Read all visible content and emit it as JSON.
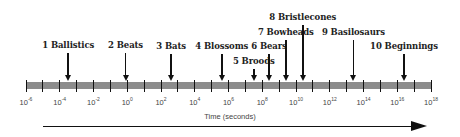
{
  "diagram": {
    "axis_title": "Time (seconds)",
    "axis": {
      "min_exp": -6,
      "max_exp": 18,
      "label_step": 2,
      "tick_step": 1
    },
    "tick_labels": [
      {
        "base": "10",
        "exp": "-6"
      },
      {
        "base": "10",
        "exp": "-4"
      },
      {
        "base": "10",
        "exp": "-2"
      },
      {
        "base": "10",
        "exp": "0"
      },
      {
        "base": "10",
        "exp": "2"
      },
      {
        "base": "10",
        "exp": "4"
      },
      {
        "base": "10",
        "exp": "6"
      },
      {
        "base": "10",
        "exp": "8"
      },
      {
        "base": "10",
        "exp": "10"
      },
      {
        "base": "10",
        "exp": "12"
      },
      {
        "base": "10",
        "exp": "14"
      },
      {
        "base": "10",
        "exp": "16"
      },
      {
        "base": "10",
        "exp": "18"
      }
    ],
    "events": [
      {
        "label": "1 Ballistics",
        "log10_seconds": -3.5,
        "label_top": 40
      },
      {
        "label": "2 Beats",
        "log10_seconds": -0.1,
        "label_top": 40
      },
      {
        "label": "3 Bats",
        "log10_seconds": 2.6,
        "label_top": 41
      },
      {
        "label": "4 Blossoms",
        "log10_seconds": 5.6,
        "label_top": 41
      },
      {
        "label": "5 Broods",
        "log10_seconds": 7.5,
        "label_top": 56
      },
      {
        "label": "6 Bears",
        "log10_seconds": 8.4,
        "label_top": 41
      },
      {
        "label": "7 Bowheads",
        "log10_seconds": 9.4,
        "label_top": 27
      },
      {
        "label": "8 Bristlecones",
        "log10_seconds": 10.4,
        "label_top": 12
      },
      {
        "label": "9 Basilosaurs",
        "log10_seconds": 13.4,
        "label_top": 27
      },
      {
        "label": "10 Beginnings",
        "log10_seconds": 16.4,
        "label_top": 41
      }
    ],
    "colors": {
      "bar": "#8c8c8c",
      "ink": "#111111",
      "label": "#222222",
      "tick_label": "#444444"
    }
  }
}
